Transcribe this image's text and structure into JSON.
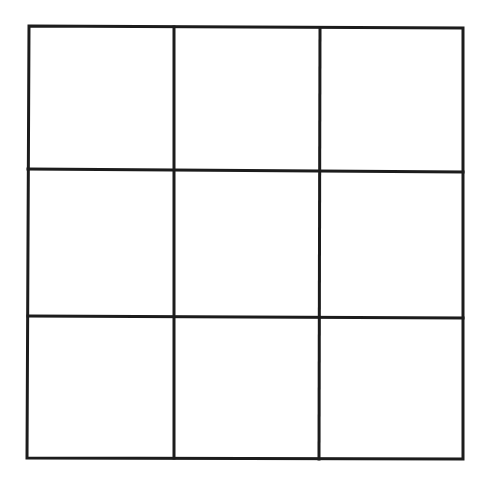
{
  "board": {
    "rows": 3,
    "cols": 3,
    "line_color": "#1c1c1c",
    "background": "#ffffff",
    "cells": [
      {
        "row": 0,
        "col": 0,
        "mark": ""
      },
      {
        "row": 0,
        "col": 1,
        "mark": ""
      },
      {
        "row": 0,
        "col": 2,
        "mark": ""
      },
      {
        "row": 1,
        "col": 0,
        "mark": ""
      },
      {
        "row": 1,
        "col": 1,
        "mark": ""
      },
      {
        "row": 1,
        "col": 2,
        "mark": ""
      },
      {
        "row": 2,
        "col": 0,
        "mark": ""
      },
      {
        "row": 2,
        "col": 1,
        "mark": ""
      },
      {
        "row": 2,
        "col": 2,
        "mark": ""
      }
    ]
  }
}
